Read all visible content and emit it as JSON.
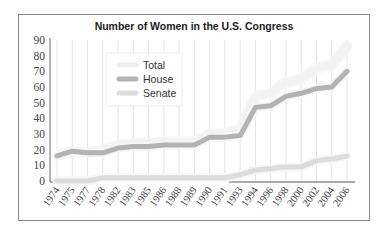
{
  "chart_data": {
    "type": "line",
    "title": "Number of Women in the U.S. Congress",
    "xlabel": "",
    "ylabel": "",
    "ylim": [
      0,
      90
    ],
    "yticks": [
      0,
      10,
      20,
      30,
      40,
      50,
      60,
      70,
      80,
      90
    ],
    "grid": {
      "vertical": true,
      "horizontal": false
    },
    "legend_position": "upper-left inside",
    "categories": [
      "1974",
      "1975",
      "1977",
      "1978",
      "1982",
      "1983",
      "1985",
      "1986",
      "1988",
      "1989",
      "1990",
      "1991",
      "1993",
      "1994",
      "1996",
      "1998",
      "2000",
      "2002",
      "2004",
      "2006"
    ],
    "series": [
      {
        "name": "Total",
        "color": "#f2f2f2",
        "values": [
          16,
          19,
          18,
          20,
          23,
          24,
          24,
          25,
          25,
          25,
          30,
          30,
          33,
          54,
          56,
          63,
          65,
          72,
          74,
          86
        ]
      },
      {
        "name": "House",
        "color": "#b3b3b3",
        "values": [
          16,
          19,
          18,
          18,
          21,
          22,
          22,
          23,
          23,
          23,
          28,
          28,
          29,
          47,
          48,
          54,
          56,
          59,
          60,
          70
        ]
      },
      {
        "name": "Senate",
        "color": "#dcdcdc",
        "values": [
          0,
          0,
          0,
          2,
          2,
          2,
          2,
          2,
          2,
          2,
          2,
          2,
          4,
          7,
          8,
          9,
          9,
          13,
          14,
          16
        ]
      }
    ]
  }
}
